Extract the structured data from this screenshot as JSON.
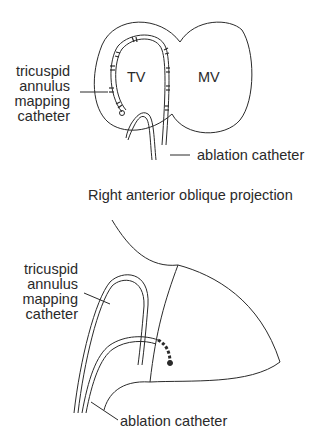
{
  "top_diagram": {
    "cut_title": "Left anterior oblique projection",
    "labels": {
      "tv": "TV",
      "mv": "MV",
      "mapping_catheter": [
        "tricuspid",
        "annulus",
        "mapping",
        "catheter"
      ],
      "ablation_catheter": "ablation  catheter"
    }
  },
  "bottom_diagram": {
    "title": "Right anterior oblique projection",
    "labels": {
      "mapping_catheter": [
        "tricuspid",
        "annulus",
        "mapping",
        "catheter"
      ],
      "ablation_catheter": "ablation  catheter"
    }
  },
  "colors": {
    "line": "#2a2a2a",
    "background": "#ffffff"
  }
}
